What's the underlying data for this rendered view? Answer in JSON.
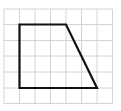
{
  "diagram": {
    "type": "grid-shape",
    "background": "#ffffff",
    "grid": {
      "columns": 7,
      "rows": 6,
      "x_lines": [
        4,
        19.5,
        35,
        50.5,
        66,
        81.5,
        97,
        112.5
      ],
      "y_lines": [
        9,
        24.5,
        40.5,
        56,
        72,
        88,
        103.5
      ],
      "line_color": "#d4d4d4",
      "line_width": 1
    },
    "shape": {
      "name": "trapezoid",
      "grid_vertices": [
        [
          1,
          1
        ],
        [
          4,
          1
        ],
        [
          6,
          5
        ],
        [
          1,
          5
        ]
      ],
      "stroke_color": "#111111",
      "stroke_width": 2.2
    }
  }
}
